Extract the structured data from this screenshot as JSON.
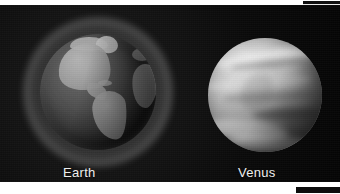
{
  "figure": {
    "background_color": "#0a0a0a",
    "page_color": "#ffffff",
    "panels": [
      {
        "name": "earth",
        "caption": "Earth",
        "subject": "earth-globe",
        "appearance": "grayscale globe with atmospheric glow halo, Americas facing viewer"
      },
      {
        "name": "venus",
        "caption": "Venus",
        "subject": "venus-globe",
        "appearance": "bright grayscale cloud-covered sphere with banded swirls"
      }
    ]
  },
  "captions": {
    "earth": "Earth",
    "venus": "Venus"
  },
  "colors": {
    "panel_background": "#0a0a0a",
    "caption_text": "#f2f2f2",
    "earth_land": "#9d9d9d",
    "earth_ocean": "#3a3a3a",
    "venus_cloud_light": "#e3e3e3",
    "venus_cloud_dark": "#5c5c5c",
    "edge_bar": "#101010"
  }
}
